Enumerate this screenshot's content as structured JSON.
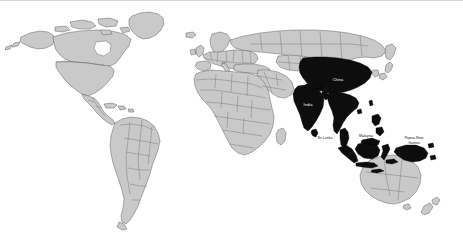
{
  "figure": {
    "width": 463,
    "height": 243,
    "background_color": "#ffffff",
    "top_rule_color": "#d9d9d9"
  },
  "legend_colors": {
    "highlighted_fill": "#0d0d0d",
    "normal_fill": "#c9c9c9",
    "outline": "#555555",
    "label_dark": "#1a1a1a",
    "label_light": "#f2f2f2"
  },
  "labels": {
    "china": "China",
    "india": "India",
    "sri_lanka": "Sri Lanka",
    "malaysia": "Malaysia",
    "papua_new_guinea_line1": "Papua New",
    "papua_new_guinea_line2": "Guinea"
  },
  "highlighted_countries": [
    "China",
    "India",
    "Nepal",
    "Bhutan",
    "Bangladesh",
    "Myanmar",
    "Thailand",
    "Laos",
    "Vietnam",
    "Cambodia",
    "Sri Lanka",
    "Malaysia",
    "Indonesia",
    "Philippines",
    "Papua New Guinea"
  ]
}
